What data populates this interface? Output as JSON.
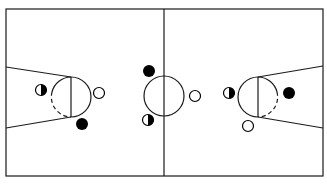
{
  "diagram": {
    "title": "",
    "type": "basketball-half-court-positions",
    "colors": {
      "line": "#1a1a1a",
      "background": "#ffffff",
      "solid_player": "#000000",
      "open_player": "#ffffff"
    },
    "court": {
      "x": 6,
      "y": 9,
      "width": 317,
      "height": 167,
      "midline_x": 164
    },
    "center_circle": {
      "cx": 164,
      "cy": 96,
      "r": 20
    },
    "left_key": {
      "lane_top": [
        [
          6,
          67
        ],
        [
          71,
          77
        ]
      ],
      "lane_bottom": [
        [
          6,
          128
        ],
        [
          71,
          117
        ]
      ],
      "ft_line_x": 71,
      "circle": {
        "cx": 71,
        "cy": 97,
        "r": 20
      }
    },
    "right_key": {
      "lane_top": [
        [
          323,
          66
        ],
        [
          258,
          77
        ]
      ],
      "lane_bottom": [
        [
          323,
          128
        ],
        [
          258,
          117
        ]
      ],
      "ft_line_x": 258,
      "circle": {
        "cx": 258,
        "cy": 97,
        "r": 20
      }
    },
    "players": [
      {
        "name": "left-half-shaded-player",
        "type": "half",
        "cx": 41,
        "cy": 90
      },
      {
        "name": "left-open-player",
        "type": "open",
        "cx": 99,
        "cy": 93
      },
      {
        "name": "left-solid-player",
        "type": "solid",
        "cx": 82,
        "cy": 124
      },
      {
        "name": "center-solid-player",
        "type": "solid",
        "cx": 149,
        "cy": 71
      },
      {
        "name": "center-half-shaded-player",
        "type": "half",
        "cx": 148,
        "cy": 120
      },
      {
        "name": "center-open-player",
        "type": "open",
        "cx": 195,
        "cy": 96
      },
      {
        "name": "right-half-shaded-player",
        "type": "half",
        "cx": 229,
        "cy": 93
      },
      {
        "name": "right-solid-player",
        "type": "solid",
        "cx": 289,
        "cy": 93
      },
      {
        "name": "right-open-player",
        "type": "open",
        "cx": 248,
        "cy": 126
      }
    ],
    "legend": {
      "solid": "filled circle",
      "open": "open circle",
      "half": "half-shaded circle"
    }
  }
}
